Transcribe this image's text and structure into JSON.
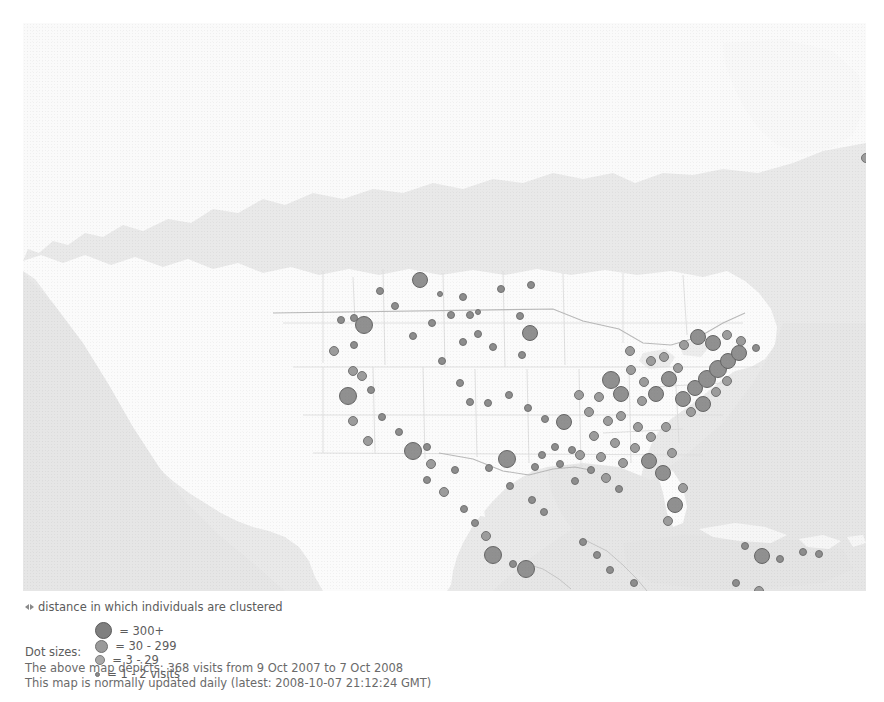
{
  "map": {
    "title": "visitor-location-map",
    "region": "North America",
    "ocean_color": "#e8e8e8",
    "land_color": "#fbfbfb",
    "border_color": "#d8d8d8",
    "coast_color": "#c9c9c9",
    "dot_fill": "#9a9a9a",
    "dot_stroke": "#6e6e6e"
  },
  "legend": {
    "distance_note": "distance in which individuals are clustered",
    "distance_marker_icon": "horizontal-distance-arrows-icon",
    "dot_sizes_label": "Dot sizes:",
    "items": [
      {
        "label": "= 300+",
        "diameter": 17,
        "fill": "#7f7f7f",
        "stroke": "#5a5a5a"
      },
      {
        "label": "= 30 - 299",
        "diameter": 13,
        "fill": "#9a9a9a",
        "stroke": "#707070"
      },
      {
        "label": "= 3 - 29",
        "diameter": 10,
        "fill": "#a8a8a8",
        "stroke": "#7d7d7d"
      },
      {
        "label": "= 1 - 2 visits",
        "diameter": 5,
        "fill": "#8a8a8a",
        "stroke": "#6e6e6e"
      }
    ]
  },
  "caption": {
    "line1": "The above map depicts: 368 visits from 9 Oct 2007 to 7 Oct 2008",
    "line2": "This map is normally updated daily (latest: 2008-10-07 21:12:24 GMT)",
    "visits": 368,
    "date_from": "9 Oct 2007",
    "date_to": "7 Oct 2008",
    "latest_update": "2008-10-07 21:12:24 GMT"
  },
  "chart_data": {
    "type": "scatter",
    "xlabel": "",
    "ylabel": "",
    "legend_position": "below",
    "grid": false,
    "size_bins": [
      {
        "name": "300+",
        "radius_px": 9
      },
      {
        "name": "30 - 299",
        "radius_px": 7
      },
      {
        "name": "3 - 29",
        "radius_px": 5
      },
      {
        "name": "1 - 2",
        "radius_px": 3
      }
    ],
    "points": [
      {
        "x": 843,
        "y": 135,
        "r": 5
      },
      {
        "x": 397,
        "y": 257,
        "r": 8
      },
      {
        "x": 417,
        "y": 271,
        "r": 3
      },
      {
        "x": 440,
        "y": 274,
        "r": 4
      },
      {
        "x": 478,
        "y": 266,
        "r": 4
      },
      {
        "x": 455,
        "y": 289,
        "r": 3
      },
      {
        "x": 508,
        "y": 262,
        "r": 4
      },
      {
        "x": 497,
        "y": 293,
        "r": 4
      },
      {
        "x": 507,
        "y": 310,
        "r": 8
      },
      {
        "x": 499,
        "y": 332,
        "r": 4
      },
      {
        "x": 331,
        "y": 295,
        "r": 4
      },
      {
        "x": 318,
        "y": 297,
        "r": 4
      },
      {
        "x": 341,
        "y": 302,
        "r": 9
      },
      {
        "x": 331,
        "y": 322,
        "r": 4
      },
      {
        "x": 311,
        "y": 328,
        "r": 5
      },
      {
        "x": 330,
        "y": 348,
        "r": 5
      },
      {
        "x": 339,
        "y": 353,
        "r": 5
      },
      {
        "x": 325,
        "y": 373,
        "r": 9
      },
      {
        "x": 348,
        "y": 367,
        "r": 4
      },
      {
        "x": 330,
        "y": 398,
        "r": 5
      },
      {
        "x": 359,
        "y": 394,
        "r": 4
      },
      {
        "x": 345,
        "y": 418,
        "r": 5
      },
      {
        "x": 376,
        "y": 409,
        "r": 4
      },
      {
        "x": 390,
        "y": 428,
        "r": 9
      },
      {
        "x": 404,
        "y": 424,
        "r": 4
      },
      {
        "x": 408,
        "y": 441,
        "r": 5
      },
      {
        "x": 404,
        "y": 457,
        "r": 4
      },
      {
        "x": 432,
        "y": 447,
        "r": 4
      },
      {
        "x": 421,
        "y": 469,
        "r": 5
      },
      {
        "x": 441,
        "y": 486,
        "r": 4
      },
      {
        "x": 452,
        "y": 500,
        "r": 4
      },
      {
        "x": 463,
        "y": 513,
        "r": 5
      },
      {
        "x": 470,
        "y": 532,
        "r": 9
      },
      {
        "x": 490,
        "y": 541,
        "r": 4
      },
      {
        "x": 503,
        "y": 546,
        "r": 9
      },
      {
        "x": 509,
        "y": 477,
        "r": 4
      },
      {
        "x": 521,
        "y": 489,
        "r": 4
      },
      {
        "x": 487,
        "y": 463,
        "r": 4
      },
      {
        "x": 466,
        "y": 445,
        "r": 4
      },
      {
        "x": 484,
        "y": 436,
        "r": 9
      },
      {
        "x": 512,
        "y": 444,
        "r": 4
      },
      {
        "x": 519,
        "y": 432,
        "r": 4
      },
      {
        "x": 532,
        "y": 424,
        "r": 4
      },
      {
        "x": 537,
        "y": 441,
        "r": 4
      },
      {
        "x": 549,
        "y": 427,
        "r": 4
      },
      {
        "x": 541,
        "y": 399,
        "r": 8
      },
      {
        "x": 522,
        "y": 396,
        "r": 4
      },
      {
        "x": 505,
        "y": 385,
        "r": 4
      },
      {
        "x": 486,
        "y": 372,
        "r": 4
      },
      {
        "x": 465,
        "y": 380,
        "r": 4
      },
      {
        "x": 447,
        "y": 379,
        "r": 4
      },
      {
        "x": 437,
        "y": 360,
        "r": 4
      },
      {
        "x": 419,
        "y": 338,
        "r": 4
      },
      {
        "x": 440,
        "y": 319,
        "r": 4
      },
      {
        "x": 455,
        "y": 311,
        "r": 4
      },
      {
        "x": 470,
        "y": 324,
        "r": 4
      },
      {
        "x": 556,
        "y": 372,
        "r": 5
      },
      {
        "x": 566,
        "y": 389,
        "r": 5
      },
      {
        "x": 576,
        "y": 374,
        "r": 5
      },
      {
        "x": 585,
        "y": 398,
        "r": 5
      },
      {
        "x": 571,
        "y": 413,
        "r": 5
      },
      {
        "x": 557,
        "y": 432,
        "r": 5
      },
      {
        "x": 578,
        "y": 434,
        "r": 5
      },
      {
        "x": 592,
        "y": 420,
        "r": 5
      },
      {
        "x": 600,
        "y": 440,
        "r": 5
      },
      {
        "x": 588,
        "y": 357,
        "r": 9
      },
      {
        "x": 598,
        "y": 371,
        "r": 8
      },
      {
        "x": 608,
        "y": 347,
        "r": 5
      },
      {
        "x": 621,
        "y": 359,
        "r": 5
      },
      {
        "x": 619,
        "y": 378,
        "r": 5
      },
      {
        "x": 633,
        "y": 371,
        "r": 8
      },
      {
        "x": 646,
        "y": 356,
        "r": 8
      },
      {
        "x": 655,
        "y": 345,
        "r": 5
      },
      {
        "x": 607,
        "y": 328,
        "r": 5
      },
      {
        "x": 628,
        "y": 338,
        "r": 5
      },
      {
        "x": 641,
        "y": 334,
        "r": 5
      },
      {
        "x": 660,
        "y": 376,
        "r": 8
      },
      {
        "x": 672,
        "y": 365,
        "r": 8
      },
      {
        "x": 684,
        "y": 356,
        "r": 9
      },
      {
        "x": 695,
        "y": 346,
        "r": 9
      },
      {
        "x": 705,
        "y": 338,
        "r": 8
      },
      {
        "x": 716,
        "y": 330,
        "r": 8
      },
      {
        "x": 693,
        "y": 369,
        "r": 5
      },
      {
        "x": 704,
        "y": 358,
        "r": 5
      },
      {
        "x": 680,
        "y": 381,
        "r": 8
      },
      {
        "x": 668,
        "y": 389,
        "r": 5
      },
      {
        "x": 661,
        "y": 322,
        "r": 5
      },
      {
        "x": 675,
        "y": 314,
        "r": 8
      },
      {
        "x": 690,
        "y": 320,
        "r": 8
      },
      {
        "x": 704,
        "y": 312,
        "r": 5
      },
      {
        "x": 718,
        "y": 318,
        "r": 5
      },
      {
        "x": 733,
        "y": 325,
        "r": 4
      },
      {
        "x": 598,
        "y": 393,
        "r": 5
      },
      {
        "x": 615,
        "y": 404,
        "r": 5
      },
      {
        "x": 628,
        "y": 414,
        "r": 5
      },
      {
        "x": 643,
        "y": 404,
        "r": 5
      },
      {
        "x": 612,
        "y": 425,
        "r": 5
      },
      {
        "x": 626,
        "y": 438,
        "r": 8
      },
      {
        "x": 640,
        "y": 450,
        "r": 8
      },
      {
        "x": 649,
        "y": 430,
        "r": 5
      },
      {
        "x": 660,
        "y": 465,
        "r": 5
      },
      {
        "x": 652,
        "y": 482,
        "r": 8
      },
      {
        "x": 645,
        "y": 498,
        "r": 5
      },
      {
        "x": 583,
        "y": 455,
        "r": 5
      },
      {
        "x": 596,
        "y": 466,
        "r": 4
      },
      {
        "x": 568,
        "y": 447,
        "r": 4
      },
      {
        "x": 552,
        "y": 458,
        "r": 4
      },
      {
        "x": 560,
        "y": 519,
        "r": 4
      },
      {
        "x": 574,
        "y": 532,
        "r": 4
      },
      {
        "x": 587,
        "y": 547,
        "r": 4
      },
      {
        "x": 611,
        "y": 560,
        "r": 4
      },
      {
        "x": 625,
        "y": 572,
        "r": 4
      },
      {
        "x": 604,
        "y": 577,
        "r": 4
      },
      {
        "x": 722,
        "y": 523,
        "r": 4
      },
      {
        "x": 739,
        "y": 533,
        "r": 8
      },
      {
        "x": 757,
        "y": 536,
        "r": 4
      },
      {
        "x": 780,
        "y": 529,
        "r": 4
      },
      {
        "x": 796,
        "y": 531,
        "r": 4
      },
      {
        "x": 713,
        "y": 560,
        "r": 4
      },
      {
        "x": 736,
        "y": 568,
        "r": 5
      },
      {
        "x": 447,
        "y": 292,
        "r": 4
      },
      {
        "x": 357,
        "y": 268,
        "r": 4
      },
      {
        "x": 372,
        "y": 283,
        "r": 4
      },
      {
        "x": 390,
        "y": 313,
        "r": 4
      },
      {
        "x": 409,
        "y": 300,
        "r": 4
      },
      {
        "x": 428,
        "y": 292,
        "r": 4
      }
    ]
  }
}
